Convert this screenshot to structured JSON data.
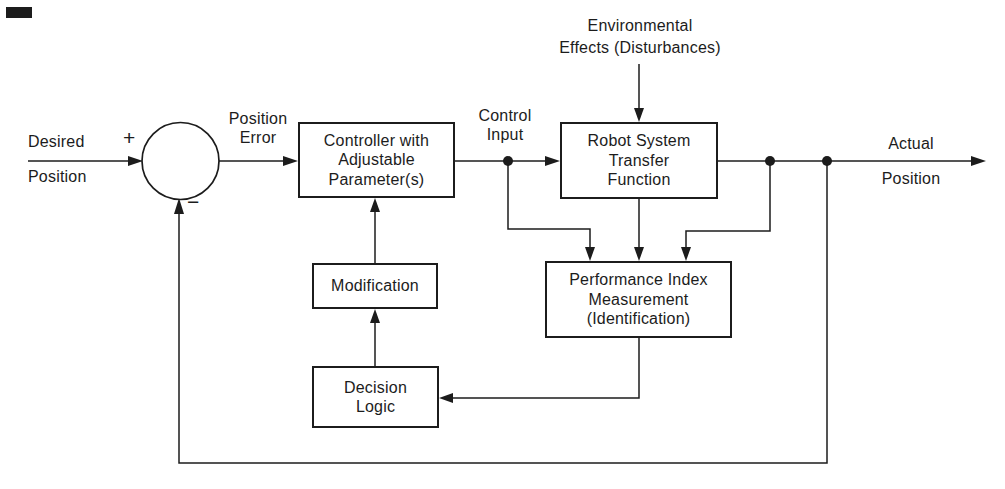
{
  "colors": {
    "ink": "#1c1c1c",
    "paper": "#ffffff"
  },
  "nodes": {
    "summing_junction": {
      "plus": "+",
      "minus": "−"
    },
    "controller": {
      "lines": [
        "Controller with",
        "Adjustable",
        "Parameter(s)"
      ]
    },
    "robot": {
      "lines": [
        "Robot System",
        "Transfer",
        "Function"
      ]
    },
    "performance": {
      "lines": [
        "Performance Index",
        "Measurement",
        "(Identification)"
      ]
    },
    "modification": {
      "lines": [
        "Modification"
      ]
    },
    "decision": {
      "lines": [
        "Decision",
        "Logic"
      ]
    }
  },
  "labels": {
    "desired": {
      "lines": [
        "Desired",
        "Position"
      ]
    },
    "position_error": {
      "lines": [
        "Position",
        "Error"
      ]
    },
    "control_input": {
      "lines": [
        "Control",
        "Input"
      ]
    },
    "environment": {
      "lines": [
        "Environmental",
        "Effects (Disturbances)"
      ]
    },
    "actual": {
      "lines": [
        "Actual",
        "Position"
      ]
    }
  }
}
